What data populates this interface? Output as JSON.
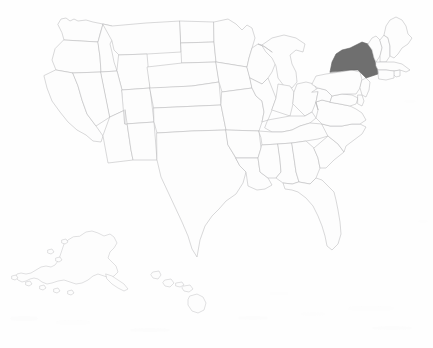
{
  "map": {
    "title": "United States Map",
    "caption": "",
    "projection": "albers-usa",
    "background_color": "#fefefe",
    "default_state_fill": "#fdfdfd",
    "default_state_stroke": "#b9b9bc",
    "highlight_fill": "#6f6f6f",
    "highlight_stroke": "#5d5d5d",
    "highlighted_states": [
      "New York"
    ],
    "insets": [
      "Alaska",
      "Hawaii"
    ],
    "states": [
      {
        "code": "WA",
        "name": "Washington",
        "highlighted": false
      },
      {
        "code": "OR",
        "name": "Oregon",
        "highlighted": false
      },
      {
        "code": "CA",
        "name": "California",
        "highlighted": false
      },
      {
        "code": "NV",
        "name": "Nevada",
        "highlighted": false
      },
      {
        "code": "ID",
        "name": "Idaho",
        "highlighted": false
      },
      {
        "code": "MT",
        "name": "Montana",
        "highlighted": false
      },
      {
        "code": "WY",
        "name": "Wyoming",
        "highlighted": false
      },
      {
        "code": "UT",
        "name": "Utah",
        "highlighted": false
      },
      {
        "code": "AZ",
        "name": "Arizona",
        "highlighted": false
      },
      {
        "code": "CO",
        "name": "Colorado",
        "highlighted": false
      },
      {
        "code": "NM",
        "name": "New Mexico",
        "highlighted": false
      },
      {
        "code": "ND",
        "name": "North Dakota",
        "highlighted": false
      },
      {
        "code": "SD",
        "name": "South Dakota",
        "highlighted": false
      },
      {
        "code": "NE",
        "name": "Nebraska",
        "highlighted": false
      },
      {
        "code": "KS",
        "name": "Kansas",
        "highlighted": false
      },
      {
        "code": "OK",
        "name": "Oklahoma",
        "highlighted": false
      },
      {
        "code": "TX",
        "name": "Texas",
        "highlighted": false
      },
      {
        "code": "MN",
        "name": "Minnesota",
        "highlighted": false
      },
      {
        "code": "IA",
        "name": "Iowa",
        "highlighted": false
      },
      {
        "code": "MO",
        "name": "Missouri",
        "highlighted": false
      },
      {
        "code": "AR",
        "name": "Arkansas",
        "highlighted": false
      },
      {
        "code": "LA",
        "name": "Louisiana",
        "highlighted": false
      },
      {
        "code": "WI",
        "name": "Wisconsin",
        "highlighted": false
      },
      {
        "code": "IL",
        "name": "Illinois",
        "highlighted": false
      },
      {
        "code": "MI",
        "name": "Michigan",
        "highlighted": false
      },
      {
        "code": "IN",
        "name": "Indiana",
        "highlighted": false
      },
      {
        "code": "OH",
        "name": "Ohio",
        "highlighted": false
      },
      {
        "code": "KY",
        "name": "Kentucky",
        "highlighted": false
      },
      {
        "code": "TN",
        "name": "Tennessee",
        "highlighted": false
      },
      {
        "code": "MS",
        "name": "Mississippi",
        "highlighted": false
      },
      {
        "code": "AL",
        "name": "Alabama",
        "highlighted": false
      },
      {
        "code": "GA",
        "name": "Georgia",
        "highlighted": false
      },
      {
        "code": "FL",
        "name": "Florida",
        "highlighted": false
      },
      {
        "code": "SC",
        "name": "South Carolina",
        "highlighted": false
      },
      {
        "code": "NC",
        "name": "North Carolina",
        "highlighted": false
      },
      {
        "code": "VA",
        "name": "Virginia",
        "highlighted": false
      },
      {
        "code": "WV",
        "name": "West Virginia",
        "highlighted": false
      },
      {
        "code": "MD",
        "name": "Maryland",
        "highlighted": false
      },
      {
        "code": "DE",
        "name": "Delaware",
        "highlighted": false
      },
      {
        "code": "PA",
        "name": "Pennsylvania",
        "highlighted": false
      },
      {
        "code": "NJ",
        "name": "New Jersey",
        "highlighted": false
      },
      {
        "code": "NY",
        "name": "New York",
        "highlighted": true
      },
      {
        "code": "CT",
        "name": "Connecticut",
        "highlighted": false
      },
      {
        "code": "RI",
        "name": "Rhode Island",
        "highlighted": false
      },
      {
        "code": "MA",
        "name": "Massachusetts",
        "highlighted": false
      },
      {
        "code": "VT",
        "name": "Vermont",
        "highlighted": false
      },
      {
        "code": "NH",
        "name": "New Hampshire",
        "highlighted": false
      },
      {
        "code": "ME",
        "name": "Maine",
        "highlighted": false
      },
      {
        "code": "AK",
        "name": "Alaska",
        "highlighted": false
      },
      {
        "code": "HI",
        "name": "Hawaii",
        "highlighted": false
      }
    ]
  }
}
